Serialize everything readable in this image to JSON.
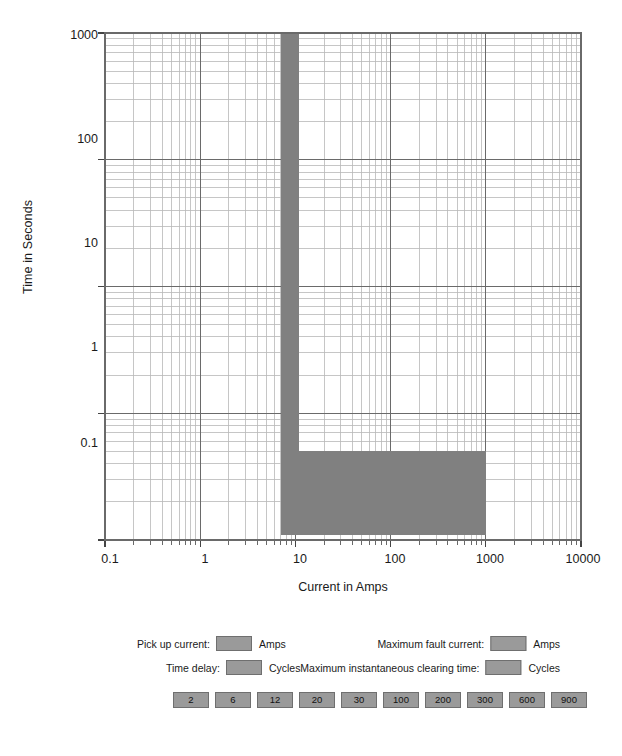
{
  "chart_data": {
    "type": "area",
    "title": "",
    "xlabel": "Current in Amps",
    "ylabel": "Time in Seconds",
    "xscale": "log",
    "yscale": "log",
    "xlim": [
      0.1,
      10000
    ],
    "ylim": [
      0.1,
      1000
    ],
    "xticks": [
      "0.1",
      "1",
      "10",
      "100",
      "1000",
      "10000"
    ],
    "xtick_values": [
      0.1,
      1,
      10,
      100,
      1000,
      10000
    ],
    "yticks": [
      "1000",
      "100",
      "10",
      "1",
      "0.1"
    ],
    "ytick_values": [
      1000,
      100,
      10,
      1,
      0.1
    ],
    "grid": "log-log minor grid on both axes",
    "legend_position": "below plot",
    "series": [
      {
        "name": "Protective device clearing band",
        "color": "#808080",
        "regions": [
          {
            "name": "pick-up / long-time delay band",
            "x_range": [
              7.0,
              11.0
            ],
            "y_range": [
              0.5,
              1000
            ]
          },
          {
            "name": "instantaneous clearing band",
            "x_range": [
              7.0,
              1000
            ],
            "y_range": [
              0.11,
              0.5
            ]
          }
        ]
      }
    ],
    "annotations": []
  },
  "axes": {
    "y_title": "Time in Seconds",
    "x_title": "Current in Amps",
    "y_labels": [
      "1000",
      "100",
      "10",
      "1",
      "0.1"
    ],
    "x_labels": [
      "0.1",
      "1",
      "10",
      "100",
      "1000",
      "10000"
    ]
  },
  "colors": {
    "band_fill": "#808080",
    "swatch_fill": "#9a9a9a",
    "swatch_border": "#6f6f6f",
    "grid_major": "#6a6a6a",
    "grid_minor": "#b8b8b8",
    "text": "#1a1a1a",
    "background": "#ffffff"
  },
  "legend": {
    "rows": [
      {
        "label": "Pick up current:",
        "unit": "Amps",
        "value": ""
      },
      {
        "label": "Time delay:",
        "unit": "Cycles",
        "value": ""
      },
      {
        "label": "Maximum fault current:",
        "unit": "Amps",
        "value": ""
      },
      {
        "label": "Maximum instantaneous clearing time:",
        "unit": "Cycles",
        "value": ""
      }
    ],
    "pills": [
      "2",
      "6",
      "12",
      "20",
      "30",
      "100",
      "200",
      "300",
      "600",
      "900"
    ]
  }
}
